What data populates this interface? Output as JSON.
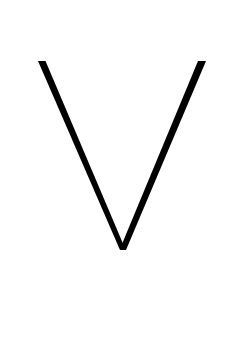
{
  "glyph": {
    "character": "V",
    "color": "#000000",
    "background": "#ffffff",
    "stroke_width": 7,
    "left_top": [
      41.5,
      61
    ],
    "right_top": [
      202,
      61
    ],
    "apex": [
      122,
      249
    ]
  }
}
